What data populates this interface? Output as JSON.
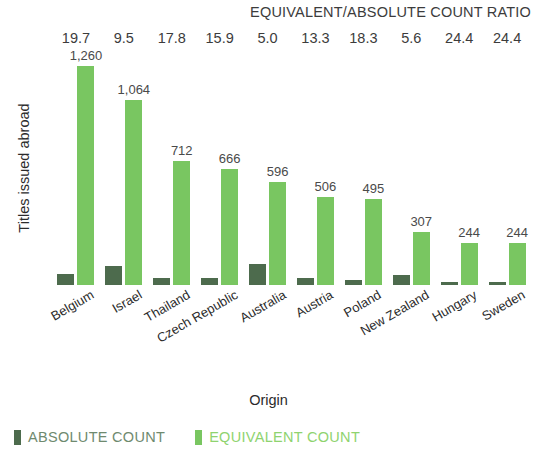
{
  "chart_data": {
    "type": "bar",
    "title": "",
    "xlabel": "Origin",
    "ylabel": "Titles issued abroad",
    "grid": false,
    "legend_position": "bottom-left",
    "ylim": [
      0,
      1320
    ],
    "categories": [
      "Belgium",
      "Israel",
      "Thailand",
      "Czech Republic",
      "Australia",
      "Austria",
      "Poland",
      "New Zealand",
      "Hungary",
      "Sweden"
    ],
    "series": [
      {
        "name": "ABSOLUTE COUNT",
        "color": "#4d6b4d",
        "values": [
          64,
          112,
          40,
          42,
          119,
          38,
          27,
          55,
          10,
          10
        ]
      },
      {
        "name": "EQUIVALENT COUNT",
        "color": "#79c661",
        "values": [
          1260,
          1064,
          712,
          666,
          596,
          506,
          495,
          307,
          244,
          244
        ],
        "labels": [
          "1,260",
          "1,064",
          "712",
          "666",
          "596",
          "506",
          "495",
          "307",
          "244",
          "244"
        ]
      }
    ],
    "ratio_header": "EQUIVALENT/ABSOLUTE COUNT RATIO",
    "ratios": [
      "19.7",
      "9.5",
      "17.8",
      "15.9",
      "5.0",
      "13.3",
      "18.3",
      "5.6",
      "24.4",
      "24.4"
    ]
  },
  "legend": {
    "absolute_label": "ABSOLUTE COUNT",
    "equivalent_label": "EQUIVALENT COUNT"
  }
}
